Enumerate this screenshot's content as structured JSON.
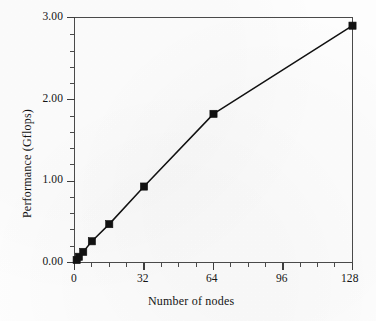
{
  "chart_data": {
    "type": "line",
    "title": "",
    "subtitle": "",
    "xlabel": "Number of nodes",
    "ylabel": "Performance (Gflops)",
    "xlim": [
      0,
      128
    ],
    "ylim": [
      0.0,
      3.0
    ],
    "x_major_ticks": [
      0,
      32,
      64,
      96,
      128
    ],
    "x_major_tick_labels": [
      "0",
      "32",
      "64",
      "96",
      "128"
    ],
    "x_minor_tick_step": 8,
    "y_major_ticks": [
      0.0,
      1.0,
      2.0,
      3.0
    ],
    "y_major_tick_labels": [
      "0.00",
      "1.00",
      "2.00",
      "3.00"
    ],
    "y_minor_tick_step": 0.2,
    "grid": false,
    "legend": null,
    "legend_position": "none",
    "marker": "filled-square",
    "marker_color": "#111111",
    "line_color": "#111111",
    "axis_color": "#4a4a4a",
    "background_color": "#fdfdfd",
    "x": [
      1,
      2,
      4,
      8,
      16,
      32,
      64,
      128
    ],
    "values": [
      0.03,
      0.07,
      0.13,
      0.26,
      0.47,
      0.93,
      1.82,
      2.9
    ],
    "series": [
      {
        "name": "Performance",
        "points": [
          {
            "x": 1,
            "y": 0.03
          },
          {
            "x": 2,
            "y": 0.07
          },
          {
            "x": 4,
            "y": 0.13
          },
          {
            "x": 8,
            "y": 0.26
          },
          {
            "x": 16,
            "y": 0.47
          },
          {
            "x": 32,
            "y": 0.93
          },
          {
            "x": 64,
            "y": 1.82
          },
          {
            "x": 128,
            "y": 2.9
          }
        ]
      }
    ]
  },
  "axes": {
    "x_title": "Number of nodes",
    "y_title": "Performance (Gflops)",
    "x_tick_labels": [
      "0",
      "32",
      "64",
      "96",
      "128"
    ],
    "y_tick_labels": [
      "0.00",
      "1.00",
      "2.00",
      "3.00"
    ]
  }
}
